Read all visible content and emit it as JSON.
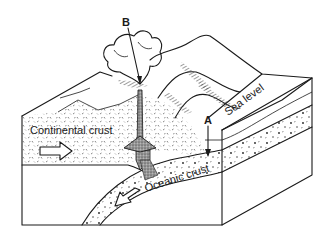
{
  "diagram": {
    "labels": {
      "continental_crust": "Continental crust",
      "oceanic_crust": "Oceanic crust",
      "sea_level": "Sea level",
      "point_a": "A",
      "point_b": "B"
    },
    "arrows": {
      "continental_motion": "right",
      "oceanic_motion": "down-left"
    },
    "colors": {
      "ink": "#1a1a1a",
      "background": "#ffffff",
      "magma": "#6b6b6b"
    }
  }
}
